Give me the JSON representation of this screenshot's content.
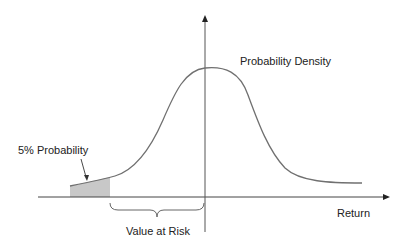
{
  "diagram": {
    "title": "Value at Risk",
    "labels": {
      "density": "Probability Density",
      "tail_probability": "5% Probability",
      "value_at_risk": "Value at Risk",
      "x_axis": "Return"
    },
    "colors": {
      "curve": "#707070",
      "axis": "#444444",
      "tail_fill": "#c8c8c8",
      "text": "#222222"
    },
    "elements": [
      "horizontal axis with arrow (Return)",
      "vertical axis with arrow",
      "bell-shaped probability density curve, peak just right of vertical axis",
      "shaded left tail region (5% probability)",
      "arrow pointing from '5% Probability' label to shaded tail",
      "curly brace spanning from tail cutoff to vertical axis labeled 'Value at Risk'"
    ]
  }
}
